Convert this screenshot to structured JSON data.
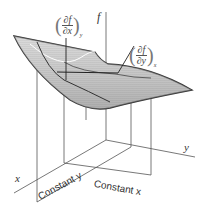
{
  "figure": {
    "type": "3d-surface-partial-derivatives",
    "axes": {
      "f": "f",
      "x": "x",
      "y": "y"
    },
    "annotations": {
      "partial_x": {
        "numerator": "∂f",
        "denominator": "∂x",
        "subscript": "y"
      },
      "partial_y": {
        "numerator": "∂f",
        "denominator": "∂y",
        "subscript": "x"
      },
      "constant_y": "Constant y",
      "constant_x": "Constant x"
    },
    "colors": {
      "surface_fill": "#c8c8c8",
      "surface_edge": "#333333",
      "axis_line": "#555555",
      "highlight_curve": "#ffffff"
    }
  }
}
